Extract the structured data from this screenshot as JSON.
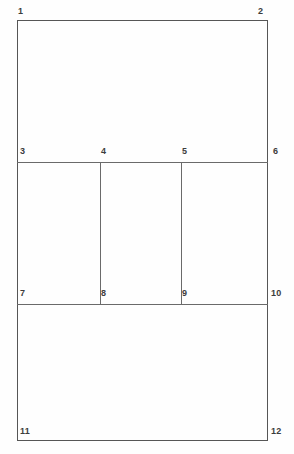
{
  "diagram": {
    "background_color": "#fefefe",
    "line_color": "#5b5b5b",
    "label_color": "#3c3c3c",
    "vertices": [
      {
        "id": "v1",
        "label": "1",
        "x": 18,
        "y": 12,
        "anchor": "top-left-outside"
      },
      {
        "id": "v2",
        "label": "2",
        "x": 258,
        "y": 12,
        "anchor": "top-right-outside"
      },
      {
        "id": "v3",
        "label": "3",
        "x": 20,
        "y": 144,
        "anchor": "inside-above-left"
      },
      {
        "id": "v4",
        "label": "4",
        "x": 100,
        "y": 144,
        "anchor": "inside-above-left"
      },
      {
        "id": "v5",
        "label": "5",
        "x": 180,
        "y": 144,
        "anchor": "inside-above-left"
      },
      {
        "id": "v6",
        "label": "6",
        "x": 272,
        "y": 144,
        "anchor": "outside-right"
      },
      {
        "id": "v7",
        "label": "7",
        "x": 20,
        "y": 286,
        "anchor": "inside-above-left"
      },
      {
        "id": "v8",
        "label": "8",
        "x": 100,
        "y": 286,
        "anchor": "inside-above-left"
      },
      {
        "id": "v9",
        "label": "9",
        "x": 180,
        "y": 286,
        "anchor": "inside-above-left"
      },
      {
        "id": "v10",
        "label": "10",
        "x": 272,
        "y": 286,
        "anchor": "outside-right"
      },
      {
        "id": "v11",
        "label": "11",
        "x": 20,
        "y": 425,
        "anchor": "inside-above-left"
      },
      {
        "id": "v12",
        "label": "12",
        "x": 272,
        "y": 425,
        "anchor": "outside-right"
      }
    ],
    "regions": [
      {
        "id": "r-top",
        "corners": "1-2-3-6",
        "x": 17,
        "y": 20,
        "w": 250,
        "h": 142
      },
      {
        "id": "r-mid-left",
        "corners": "3-4-7-8",
        "x": 17,
        "y": 162,
        "w": 83,
        "h": 142
      },
      {
        "id": "r-mid-center",
        "corners": "4-5-8-9",
        "x": 100,
        "y": 162,
        "w": 81,
        "h": 142
      },
      {
        "id": "r-mid-right",
        "corners": "5-6-9-10",
        "x": 181,
        "y": 162,
        "w": 86,
        "h": 142
      },
      {
        "id": "r-bottom",
        "corners": "7-10-11-12",
        "x": 17,
        "y": 304,
        "w": 250,
        "h": 137
      }
    ],
    "edges": {
      "outer_left": {
        "x": 17,
        "y": 20,
        "length": 421,
        "orientation": "vertical"
      },
      "outer_right": {
        "x": 267,
        "y": 20,
        "length": 421,
        "orientation": "vertical"
      },
      "outer_top": {
        "x": 17,
        "y": 20,
        "length": 251,
        "orientation": "horizontal"
      },
      "outer_bottom": {
        "x": 17,
        "y": 440,
        "length": 251,
        "orientation": "horizontal"
      },
      "divider_upper": {
        "x": 17,
        "y": 162,
        "length": 251,
        "orientation": "horizontal"
      },
      "divider_lower": {
        "x": 17,
        "y": 304,
        "length": 251,
        "orientation": "horizontal"
      },
      "column_left": {
        "x": 100,
        "y": 162,
        "length": 143,
        "orientation": "vertical"
      },
      "column_right": {
        "x": 181,
        "y": 162,
        "length": 143,
        "orientation": "vertical"
      }
    }
  }
}
